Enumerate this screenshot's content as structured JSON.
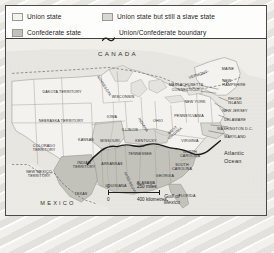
{
  "map": {
    "title": "United States during the Civil War",
    "legend": {
      "items": [
        {
          "id": "union-state",
          "label": "Union state",
          "symbol": "swatch",
          "color": "#f3f2ee"
        },
        {
          "id": "union-slave-state",
          "label": "Union state but still a slave state",
          "symbol": "swatch",
          "color": "#d8d7d1"
        },
        {
          "id": "confederate-state",
          "label": "Confederate state",
          "symbol": "swatch",
          "color": "#c2c1ba"
        },
        {
          "id": "union-confederate-boundary",
          "label": "Union/Confederate boundary",
          "symbol": "wavy-line",
          "color": "#262626"
        }
      ]
    },
    "scale": {
      "miles": {
        "start": "0",
        "end": "250 miles"
      },
      "kilometres": {
        "start": "0",
        "end": "400 kilometres"
      }
    },
    "regions": [
      {
        "name": "CANADA",
        "x": 112,
        "y": 48,
        "class": "big"
      },
      {
        "name": "MEXICO",
        "x": 52,
        "y": 197,
        "class": "mid"
      },
      {
        "name": "Atlantic\nOcean",
        "x": 228,
        "y": 152,
        "class": "ocean"
      },
      {
        "name": "Gulf of\nMexico",
        "x": 166,
        "y": 193,
        "class": "gulf"
      }
    ],
    "states": [
      {
        "name": "DAKOTA TERRITORY",
        "x": 56,
        "y": 86,
        "class": ""
      },
      {
        "name": "NEBRASKA TERRITORY",
        "x": 55,
        "y": 115,
        "class": ""
      },
      {
        "name": "COLORADO\nTERRITORY",
        "x": 38,
        "y": 142,
        "class": ""
      },
      {
        "name": "NEW MEXICO\nTERRITORY",
        "x": 33,
        "y": 168,
        "class": ""
      },
      {
        "name": "INDIAN\nTERRITORY",
        "x": 78,
        "y": 159,
        "class": ""
      },
      {
        "name": "KANSAS",
        "x": 80,
        "y": 134,
        "class": ""
      },
      {
        "name": "TEXAS",
        "x": 75,
        "y": 188,
        "class": ""
      },
      {
        "name": "MINNESOTA",
        "x": 98,
        "y": 80,
        "class": "rot-mn"
      },
      {
        "name": "WISCONSIN",
        "x": 117,
        "y": 91,
        "class": ""
      },
      {
        "name": "IOWA",
        "x": 106,
        "y": 111,
        "class": ""
      },
      {
        "name": "ILLINOIS",
        "x": 124,
        "y": 124,
        "class": ""
      },
      {
        "name": "MISSOURI",
        "x": 104,
        "y": 135,
        "class": ""
      },
      {
        "name": "ARKANSAS",
        "x": 106,
        "y": 158,
        "class": ""
      },
      {
        "name": "LOUISIANA",
        "x": 110,
        "y": 180,
        "class": ""
      },
      {
        "name": "MISSISSIPPI",
        "x": 124,
        "y": 177,
        "class": "rot-ms"
      },
      {
        "name": "ALABAMA",
        "x": 140,
        "y": 177,
        "class": ""
      },
      {
        "name": "GEORGIA",
        "x": 159,
        "y": 170,
        "class": ""
      },
      {
        "name": "FLORIDA",
        "x": 181,
        "y": 190,
        "class": ""
      },
      {
        "name": "TENNESSEE",
        "x": 134,
        "y": 148,
        "class": ""
      },
      {
        "name": "KENTUCKY",
        "x": 140,
        "y": 135,
        "class": ""
      },
      {
        "name": "INDIANA",
        "x": 137,
        "y": 119,
        "class": "rot-mn"
      },
      {
        "name": "OHIO",
        "x": 152,
        "y": 115,
        "class": ""
      },
      {
        "name": "WEST\nVIRGINIA",
        "x": 168,
        "y": 126,
        "class": "rot-wv"
      },
      {
        "name": "VIRGINIA",
        "x": 184,
        "y": 135,
        "class": ""
      },
      {
        "name": "NORTH\nCAROLINA",
        "x": 184,
        "y": 148,
        "class": ""
      },
      {
        "name": "SOUTH\nCAROLINA",
        "x": 176,
        "y": 161,
        "class": ""
      },
      {
        "name": "PENNSYLVANIA",
        "x": 183,
        "y": 110,
        "class": ""
      },
      {
        "name": "NEW YORK",
        "x": 189,
        "y": 96,
        "class": ""
      },
      {
        "name": "MAINE",
        "x": 222,
        "y": 63,
        "class": ""
      },
      {
        "name": "VERMONT",
        "x": 192,
        "y": 69,
        "class": "rot-vt"
      },
      {
        "name": "NEW\nHAMPSHIRE",
        "x": 228,
        "y": 77,
        "class": "rt"
      },
      {
        "name": "MASSACHUSETTS",
        "x": 180,
        "y": 79,
        "class": "lt"
      },
      {
        "name": "CONNECTICUT",
        "x": 180,
        "y": 84,
        "class": "lt"
      },
      {
        "name": "RHODE\nISLAND",
        "x": 229,
        "y": 95,
        "class": "rt"
      },
      {
        "name": "NEW JERSEY",
        "x": 229,
        "y": 105,
        "class": "rt"
      },
      {
        "name": "DELAWARE",
        "x": 229,
        "y": 114,
        "class": "rt"
      },
      {
        "name": "WASHINGTON D.C.",
        "x": 229,
        "y": 123,
        "class": "rt"
      },
      {
        "name": "MARYLAND",
        "x": 229,
        "y": 131,
        "class": "rt"
      }
    ]
  }
}
